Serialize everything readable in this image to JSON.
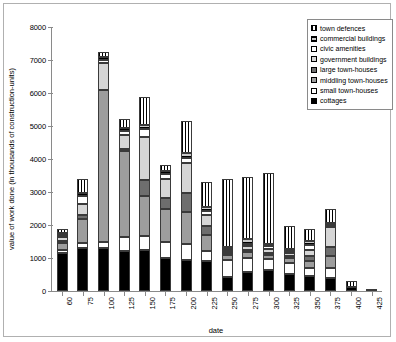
{
  "chart_data": {
    "type": "bar",
    "stacked": true,
    "title": "",
    "xlabel": "date",
    "ylabel": "value of work done (in thousands of construction-units)",
    "categories": [
      "60",
      "75",
      "100",
      "125",
      "150",
      "175",
      "200",
      "225",
      "250",
      "275",
      "300",
      "325",
      "350",
      "375",
      "400",
      "425"
    ],
    "ylim": [
      0,
      8000
    ],
    "yticks": [
      "0",
      "1000",
      "2000",
      "3000",
      "4000",
      "5000",
      "6000",
      "7000",
      "8000"
    ],
    "grid": false,
    "legend_position": "top-right",
    "series": [
      {
        "name": "cottages",
        "key": "cottages",
        "fill": "solid-black",
        "values": [
          1150,
          1300,
          1300,
          1200,
          1250,
          1000,
          950,
          900,
          430,
          580,
          640,
          520,
          470,
          400,
          110,
          70
        ]
      },
      {
        "name": "small town-houses",
        "key": "small",
        "fill": "solid-white",
        "values": [
          80,
          170,
          200,
          450,
          420,
          480,
          480,
          320,
          520,
          420,
          330,
          330,
          230,
          300,
          0,
          0
        ]
      },
      {
        "name": "middling town-houses",
        "key": "middling",
        "fill": "gray-medium",
        "values": [
          230,
          700,
          4600,
          2580,
          1200,
          1000,
          950,
          480,
          130,
          180,
          130,
          150,
          220,
          370,
          0,
          0
        ]
      },
      {
        "name": "large town-houses",
        "key": "large",
        "fill": "gray-dark",
        "values": [
          60,
          130,
          0,
          60,
          500,
          330,
          600,
          260,
          40,
          70,
          60,
          60,
          130,
          260,
          0,
          0
        ]
      },
      {
        "name": "government buildings",
        "key": "gov",
        "fill": "gray-light",
        "values": [
          120,
          340,
          800,
          440,
          1300,
          600,
          900,
          340,
          80,
          100,
          110,
          90,
          180,
          600,
          0,
          0
        ]
      },
      {
        "name": "civic amenities",
        "key": "civic",
        "fill": "solid-white",
        "values": [
          50,
          230,
          100,
          130,
          240,
          140,
          160,
          130,
          60,
          70,
          80,
          70,
          160,
          70,
          0,
          0
        ]
      },
      {
        "name": "commercial buildings",
        "key": "commercial",
        "fill": "horizontal-hatch",
        "values": [
          40,
          110,
          100,
          80,
          130,
          100,
          130,
          110,
          50,
          150,
          60,
          50,
          130,
          70,
          0,
          0
        ]
      },
      {
        "name": "town defences",
        "key": "defences",
        "fill": "vertical-hatch",
        "values": [
          110,
          420,
          150,
          280,
          840,
          170,
          990,
          770,
          2050,
          1900,
          2170,
          700,
          350,
          430,
          190,
          0
        ]
      }
    ]
  },
  "legend": {
    "items": [
      {
        "label": "town defences",
        "swatch": "vertical-hatch"
      },
      {
        "label": "commercial buildings",
        "swatch": "horizontal-hatch"
      },
      {
        "label": "civic amenities",
        "swatch": "solid-white"
      },
      {
        "label": "government buildings",
        "swatch": "gray-light"
      },
      {
        "label": "large town-houses",
        "swatch": "gray-dark"
      },
      {
        "label": "middling town-houses",
        "swatch": "gray-medium"
      },
      {
        "label": "small town-houses",
        "swatch": "solid-white"
      },
      {
        "label": "cottages",
        "swatch": "solid-black"
      }
    ]
  }
}
